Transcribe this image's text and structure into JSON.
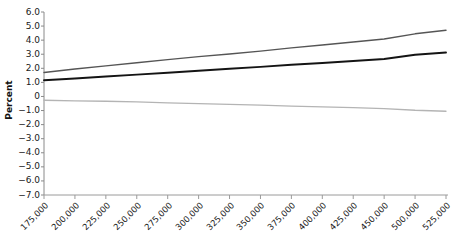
{
  "chart_data": {
    "type": "line",
    "title": "",
    "xlabel": "",
    "ylabel": "Percent",
    "xlim": [
      175000,
      525000
    ],
    "ylim": [
      -7.0,
      6.0
    ],
    "grid": false,
    "legend": "none",
    "y_ticks": [
      "6.0",
      "5.0",
      "4.0",
      "3.0",
      "2.0",
      "1.0",
      "0",
      "-1.0",
      "-2.0",
      "-3.0",
      "-4.0",
      "-5.0",
      "-6.0",
      "-7.0"
    ],
    "y_tick_values": [
      6.0,
      5.0,
      4.0,
      3.0,
      2.0,
      1.0,
      0.0,
      -1.0,
      -2.0,
      -3.0,
      -4.0,
      -5.0,
      -6.0,
      -7.0
    ],
    "x_tick_labels": [
      "175,000",
      "200,000",
      "225,000",
      "250,000",
      "275,000",
      "300,000",
      "325,000",
      "350,000",
      "375,000",
      "400,000",
      "425,000",
      "450,000",
      "500,000",
      "525,000"
    ],
    "x_tick_values": [
      175000,
      200000,
      225000,
      250000,
      275000,
      300000,
      325000,
      350000,
      375000,
      400000,
      425000,
      450000,
      500000,
      525000
    ],
    "x": [
      175000,
      200000,
      225000,
      250000,
      275000,
      300000,
      325000,
      350000,
      375000,
      400000,
      425000,
      450000,
      500000,
      525000
    ],
    "series": [
      {
        "name": "upper-line",
        "color": "#555555",
        "width": 1.4,
        "values": [
          1.7,
          1.95,
          2.17,
          2.4,
          2.62,
          2.83,
          3.02,
          3.22,
          3.45,
          3.66,
          3.87,
          4.08,
          4.45,
          4.7
        ]
      },
      {
        "name": "middle-line",
        "color": "#141414",
        "width": 1.9,
        "values": [
          1.15,
          1.28,
          1.42,
          1.55,
          1.68,
          1.83,
          1.97,
          2.1,
          2.25,
          2.38,
          2.52,
          2.66,
          2.96,
          3.12
        ]
      },
      {
        "name": "lower-line",
        "color": "#b4b4b4",
        "width": 1.3,
        "values": [
          -0.27,
          -0.31,
          -0.34,
          -0.39,
          -0.45,
          -0.51,
          -0.56,
          -0.62,
          -0.68,
          -0.74,
          -0.8,
          -0.86,
          -0.98,
          -1.05
        ]
      }
    ]
  },
  "axis": {
    "y_axis_line_color": "#8a8a8a",
    "x_axis_line_color": "#9a9a9a"
  }
}
